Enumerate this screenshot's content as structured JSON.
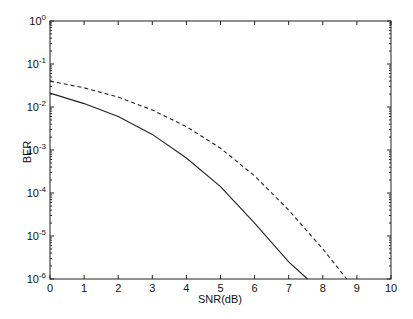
{
  "chart_data": {
    "type": "line",
    "title": "",
    "xlabel": "SNR(dB)",
    "ylabel": "BER",
    "xlim": [
      0,
      10
    ],
    "ylim": [
      1e-06,
      1
    ],
    "yscale": "log",
    "grid": false,
    "legend": null,
    "x_ticks": [
      "0",
      "1",
      "2",
      "3",
      "4",
      "5",
      "6",
      "7",
      "8",
      "9",
      "10"
    ],
    "y_ticks": [
      {
        "base": "10",
        "exp": "0"
      },
      {
        "base": "10",
        "exp": "-1"
      },
      {
        "base": "10",
        "exp": "-2"
      },
      {
        "base": "10",
        "exp": "-3"
      },
      {
        "base": "10",
        "exp": "-4"
      },
      {
        "base": "10",
        "exp": "-5"
      },
      {
        "base": "10",
        "exp": "-6"
      }
    ],
    "series": [
      {
        "name": "solid",
        "style": "solid",
        "x": [
          0,
          1,
          2,
          3,
          4,
          5,
          6,
          7,
          7.55
        ],
        "values": [
          0.021,
          0.012,
          0.006,
          0.0023,
          0.00065,
          0.00014,
          2e-05,
          2.5e-06,
          1e-06
        ]
      },
      {
        "name": "dashed",
        "style": "dashed",
        "x": [
          0,
          1,
          2,
          3,
          4,
          5,
          6,
          7,
          8,
          8.7
        ],
        "values": [
          0.04,
          0.028,
          0.017,
          0.0085,
          0.0035,
          0.0011,
          0.00025,
          4e-05,
          5e-06,
          1e-06
        ]
      }
    ]
  }
}
